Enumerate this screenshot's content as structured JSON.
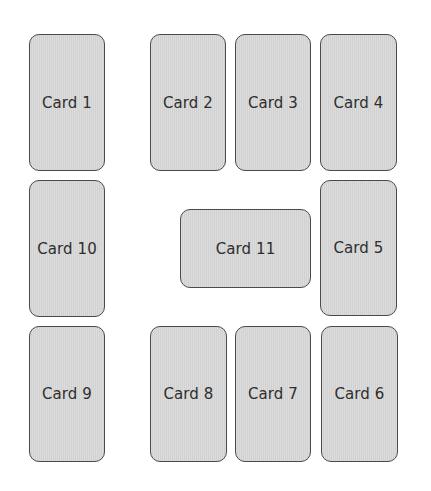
{
  "colors": {
    "background": "#ffffff",
    "card_fill": "#d8d8d8",
    "card_border": "#4a4a4a",
    "text": "#2e2e2e"
  },
  "cards": [
    {
      "label": "Card 1",
      "x": 29,
      "y": 34,
      "w": 76,
      "h": 137
    },
    {
      "label": "Card 2",
      "x": 150,
      "y": 34,
      "w": 76,
      "h": 137
    },
    {
      "label": "Card 3",
      "x": 235,
      "y": 34,
      "w": 76,
      "h": 137
    },
    {
      "label": "Card 4",
      "x": 320,
      "y": 34,
      "w": 77,
      "h": 137
    },
    {
      "label": "Card 5",
      "x": 320,
      "y": 180,
      "w": 77,
      "h": 136
    },
    {
      "label": "Card 6",
      "x": 321,
      "y": 326,
      "w": 77,
      "h": 136
    },
    {
      "label": "Card 7",
      "x": 235,
      "y": 326,
      "w": 76,
      "h": 136
    },
    {
      "label": "Card 8",
      "x": 150,
      "y": 326,
      "w": 77,
      "h": 136
    },
    {
      "label": "Card 9",
      "x": 29,
      "y": 326,
      "w": 76,
      "h": 136
    },
    {
      "label": "Card 10",
      "x": 29,
      "y": 180,
      "w": 76,
      "h": 137
    },
    {
      "label": "Card 11",
      "x": 180,
      "y": 209,
      "w": 131,
      "h": 79
    }
  ]
}
